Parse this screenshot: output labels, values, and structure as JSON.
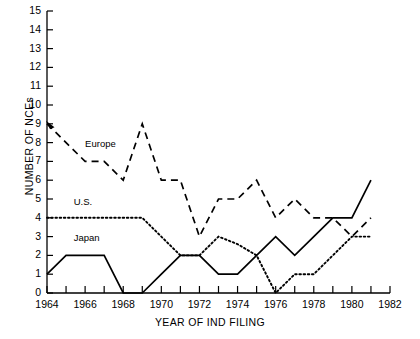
{
  "chart_data": {
    "type": "line",
    "title": "",
    "xlabel": "YEAR OF IND FILING",
    "ylabel": "NUMBER OF NCEs",
    "xlim": [
      1964,
      1982
    ],
    "ylim": [
      0,
      15
    ],
    "x_ticks_major": [
      1964,
      1966,
      1968,
      1970,
      1972,
      1974,
      1976,
      1978,
      1980,
      1982
    ],
    "x_ticks_minor": [
      1965,
      1967,
      1969,
      1971,
      1973,
      1975,
      1977,
      1979,
      1981
    ],
    "y_ticks": [
      0,
      1,
      2,
      3,
      4,
      5,
      6,
      7,
      8,
      9,
      10,
      11,
      12,
      13,
      14,
      15
    ],
    "grid": false,
    "legend_position": "inline-annotations",
    "x": [
      1964,
      1965,
      1966,
      1967,
      1968,
      1969,
      1970,
      1971,
      1972,
      1973,
      1974,
      1975,
      1976,
      1977,
      1978,
      1979,
      1980,
      1981
    ],
    "series": [
      {
        "name": "Europe",
        "style": "dashed",
        "color": "#000000",
        "label_x": 1966.0,
        "label_y": 7.85,
        "values": [
          9,
          8,
          7,
          7,
          6,
          9,
          6,
          6,
          3,
          5,
          5,
          6,
          4,
          5,
          4,
          4,
          3,
          4
        ]
      },
      {
        "name": "U.S.",
        "style": "dotted",
        "color": "#000000",
        "label_x": 1965.4,
        "label_y": 4.8,
        "values": [
          4,
          4,
          4,
          4,
          4,
          4,
          3,
          2,
          2,
          3,
          2.6,
          2,
          0,
          1,
          1,
          2,
          3,
          3
        ]
      },
      {
        "name": "Japan",
        "style": "solid",
        "color": "#000000",
        "label_x": 1965.4,
        "label_y": 2.85,
        "values": [
          1,
          2,
          2,
          2,
          0,
          0,
          1,
          2,
          2,
          1,
          1,
          2,
          3,
          2,
          3,
          4,
          4,
          6
        ]
      }
    ]
  }
}
